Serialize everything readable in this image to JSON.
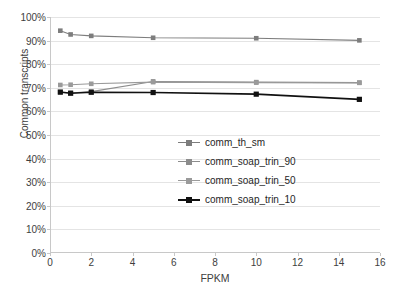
{
  "chart_data": {
    "type": "line",
    "title": "",
    "xlabel": "FPKM",
    "ylabel": "Common transcripts",
    "xlim": [
      0,
      16
    ],
    "ylim": [
      0,
      100
    ],
    "grid": true,
    "legend_position": "inside-center-right",
    "x": [
      0.5,
      1,
      2,
      5,
      10,
      15
    ],
    "xticks": [
      "0",
      "2",
      "4",
      "6",
      "8",
      "10",
      "12",
      "14",
      "16"
    ],
    "xtick_values": [
      0,
      2,
      4,
      6,
      8,
      10,
      12,
      14,
      16
    ],
    "yticks": [
      "0%",
      "10%",
      "20%",
      "30%",
      "40%",
      "50%",
      "60%",
      "70%",
      "80%",
      "90%",
      "100%"
    ],
    "ytick_values": [
      0,
      10,
      20,
      30,
      40,
      50,
      60,
      70,
      80,
      90,
      100
    ],
    "series": [
      {
        "name": "comm_th_sm",
        "color": "#7d7d7d",
        "marker": "square",
        "values": [
          94.2,
          92.6,
          92.0,
          91.2,
          91.0,
          90.1
        ]
      },
      {
        "name": "comm_soap_trin_90",
        "color": "#8c8c8c",
        "marker": "square",
        "values": [
          68.0,
          67.8,
          68.4,
          72.7,
          72.4,
          72.2
        ]
      },
      {
        "name": "comm_soap_trin_50",
        "color": "#9a9a9a",
        "marker": "square",
        "values": [
          71.2,
          71.3,
          71.7,
          72.4,
          72.2,
          72.1
        ]
      },
      {
        "name": "comm_soap_trin_10",
        "color": "#111111",
        "marker": "square",
        "values": [
          68.2,
          67.7,
          68.1,
          68.0,
          67.3,
          65.1
        ]
      }
    ]
  },
  "legend": {
    "items": [
      {
        "label": "comm_th_sm"
      },
      {
        "label": "comm_soap_trin_90"
      },
      {
        "label": "comm_soap_trin_50"
      },
      {
        "label": "comm_soap_trin_10"
      }
    ]
  },
  "axes": {
    "y_title": "Common transcripts",
    "x_title": "FPKM"
  }
}
